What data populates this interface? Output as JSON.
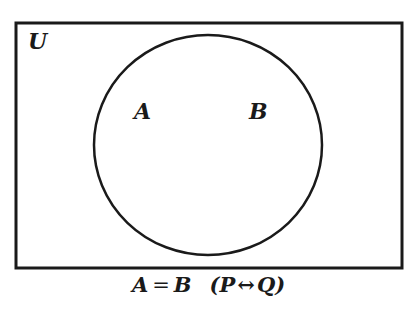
{
  "diagram": {
    "type": "venn",
    "universe": {
      "label": "U",
      "rect": {
        "x": 16,
        "y": 23,
        "width": 386,
        "height": 245
      }
    },
    "sets": [
      {
        "label": "A",
        "label_pos": {
          "x": 134,
          "y": 100
        }
      },
      {
        "label": "B",
        "label_pos": {
          "x": 249,
          "y": 100
        }
      }
    ],
    "circle": {
      "cx": 208,
      "cy": 145,
      "rx": 114,
      "ry": 110
    },
    "relation": "A and B are identical sets (single coincident circle)",
    "stroke_color": "#1a1a1a",
    "background_color": "#ffffff"
  },
  "labels": {
    "universe": "U",
    "set_a": "A",
    "set_b": "B"
  },
  "caption": {
    "left": "A",
    "equals": "=",
    "right": "B",
    "paren_open": "(",
    "p": "P",
    "biconditional": "↔",
    "q": "Q",
    "paren_close": ")"
  }
}
